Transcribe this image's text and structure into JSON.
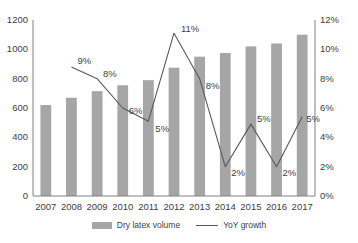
{
  "chart_data": {
    "type": "bar",
    "title": "",
    "subtitle": "",
    "xlabel": "",
    "ylabel": "",
    "y2label": "",
    "categories": [
      "2007",
      "2008",
      "2009",
      "2010",
      "2011",
      "2012",
      "2013",
      "2014",
      "2015",
      "2016",
      "2017"
    ],
    "ylim": [
      0,
      1200
    ],
    "y2lim": [
      0,
      12
    ],
    "y_ticks": [
      "0",
      "200",
      "400",
      "600",
      "800",
      "1000",
      "1200"
    ],
    "y2_ticks": [
      "0%",
      "2%",
      "4%",
      "6%",
      "8%",
      "10%",
      "12%"
    ],
    "grid": false,
    "legend_position": "bottom",
    "series": [
      {
        "name": "Dry latex volume",
        "type": "bar",
        "axis": "left",
        "color": "#a6a6a6",
        "values": [
          620,
          670,
          715,
          755,
          790,
          875,
          950,
          975,
          1020,
          1040,
          1100
        ]
      },
      {
        "name": "YoY growth",
        "type": "line",
        "axis": "right",
        "color": "#595959",
        "values": [
          null,
          8.8,
          8.0,
          6.0,
          5.1,
          11.1,
          8.0,
          2.0,
          4.9,
          2.0,
          5.4
        ],
        "point_labels": [
          null,
          "9%",
          "8%",
          "6%",
          "5%",
          "11%",
          "8%",
          "2%",
          "5%",
          "2%",
          "5%"
        ]
      }
    ]
  },
  "legend": {
    "entries": [
      {
        "label": "Dry latex volume",
        "marker": "bar-swatch"
      },
      {
        "label": "YoY growth",
        "marker": "line-swatch"
      }
    ]
  }
}
